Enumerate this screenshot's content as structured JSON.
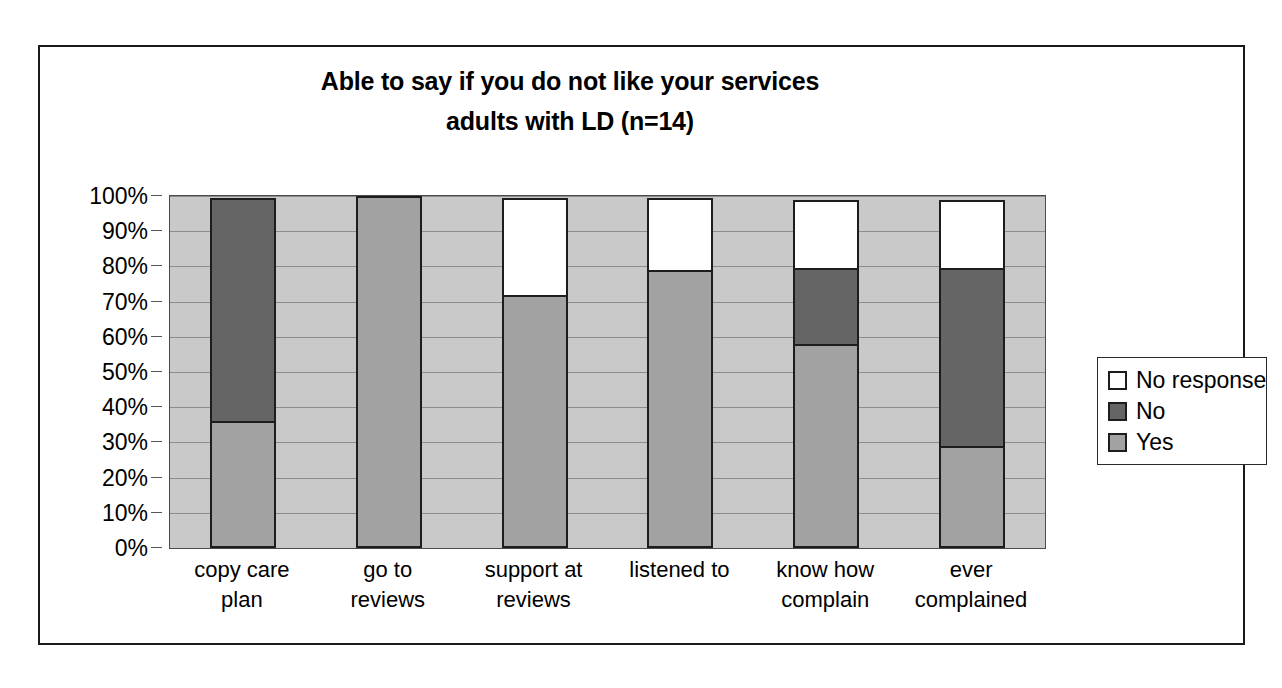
{
  "chart_data": {
    "type": "bar",
    "subtype": "stacked-percent",
    "title": "Able to say if you do not like your services adults with LD (n=14)",
    "title_lines": [
      "Able to say if you do not like your services",
      "adults with LD (n=14)"
    ],
    "xlabel": "",
    "ylabel": "",
    "ylim": [
      0,
      100
    ],
    "grid": true,
    "legend_position": "right",
    "categories": [
      "copy care plan",
      "go to reviews",
      "support at reviews",
      "listened to",
      "know how complain",
      "ever complained"
    ],
    "category_lines": [
      [
        "copy care",
        "plan"
      ],
      [
        "go to",
        "reviews"
      ],
      [
        "support at",
        "reviews"
      ],
      [
        "listened to",
        ""
      ],
      [
        "know how",
        "complain"
      ],
      [
        "ever",
        "complained"
      ]
    ],
    "series": [
      {
        "name": "Yes",
        "color": "#a2a2a2",
        "values": [
          36,
          100,
          72,
          79,
          58,
          29
        ]
      },
      {
        "name": "No",
        "color": "#656565",
        "values": [
          64,
          0,
          0,
          0,
          22,
          51
        ]
      },
      {
        "name": "No response",
        "color": "#ffffff",
        "values": [
          0,
          0,
          28,
          21,
          20,
          20
        ]
      }
    ],
    "ytick_labels": [
      "100%",
      "90%",
      "80%",
      "70%",
      "60%",
      "50%",
      "40%",
      "30%",
      "20%",
      "10%",
      "0%"
    ],
    "ytick_values": [
      100,
      90,
      80,
      70,
      60,
      50,
      40,
      30,
      20,
      10,
      0
    ],
    "plot_background": "#c9c9c9",
    "gridline_color": "#8d8d8d",
    "border_color": "#1d1d1d"
  },
  "legend": {
    "items": [
      {
        "label": "No response",
        "color": "#ffffff"
      },
      {
        "label": "No",
        "color": "#656565"
      },
      {
        "label": "Yes",
        "color": "#a2a2a2"
      }
    ]
  }
}
